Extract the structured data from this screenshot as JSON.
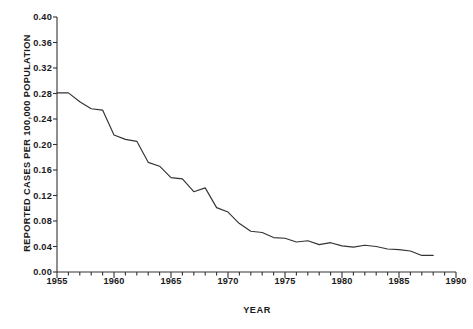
{
  "chart_data": {
    "type": "line",
    "title": "",
    "xlabel": "YEAR",
    "ylabel": "REPORTED CASES PER 100,000 POPULATION",
    "xlim": [
      1955,
      1990
    ],
    "ylim": [
      0.0,
      0.4
    ],
    "grid": false,
    "legend": "none",
    "x_major_ticks": [
      1955,
      1960,
      1965,
      1970,
      1975,
      1980,
      1985,
      1990
    ],
    "x_minor_tick_interval": 1,
    "y_ticks": [
      0.0,
      0.04,
      0.08,
      0.12,
      0.16,
      0.2,
      0.24,
      0.28,
      0.32,
      0.36,
      0.4
    ],
    "y_tick_labels": [
      "0.00",
      "0.04",
      "0.08",
      "0.12",
      "0.16",
      "0.20",
      "0.24",
      "0.28",
      "0.32",
      "0.36",
      "0.40"
    ],
    "x_tick_labels": [
      "1955",
      "1960",
      "1965",
      "1970",
      "1975",
      "1980",
      "1985",
      "1990"
    ],
    "series": [
      {
        "name": "Reported cases per 100,000 population",
        "color": "#333333",
        "x": [
          1955,
          1956,
          1957,
          1958,
          1959,
          1960,
          1961,
          1962,
          1963,
          1964,
          1965,
          1966,
          1967,
          1968,
          1969,
          1970,
          1971,
          1972,
          1973,
          1974,
          1975,
          1976,
          1977,
          1978,
          1979,
          1980,
          1981,
          1982,
          1983,
          1984,
          1985,
          1986,
          1987,
          1988
        ],
        "values": [
          0.281,
          0.281,
          0.267,
          0.256,
          0.254,
          0.215,
          0.208,
          0.205,
          0.172,
          0.166,
          0.148,
          0.146,
          0.126,
          0.132,
          0.101,
          0.094,
          0.076,
          0.064,
          0.062,
          0.054,
          0.053,
          0.047,
          0.049,
          0.043,
          0.046,
          0.041,
          0.039,
          0.042,
          0.04,
          0.036,
          0.035,
          0.033,
          0.026,
          0.026
        ]
      }
    ]
  },
  "axis": {
    "y_title": "REPORTED CASES PER 100,000 POPULATION",
    "x_title": "YEAR"
  }
}
